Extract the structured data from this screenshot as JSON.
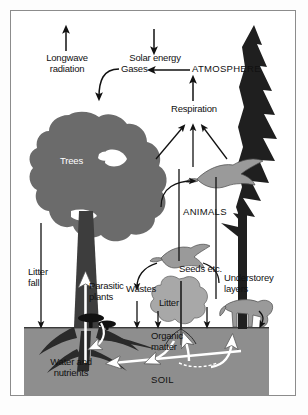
{
  "diagram": {
    "colors": {
      "background": "#ffffff",
      "border": "#8c8c8c",
      "canopy_gray": "#6b6b6b",
      "conifer_dark": "#1f1f1f",
      "soil_gray": "#8e8e8e",
      "animal_gray": "#9a9a9a",
      "shrub_gray": "#a8a8a8",
      "arrow_black": "#111111",
      "arrow_white": "#ffffff",
      "text": "#111111",
      "text_on_dark": "#ffffff"
    },
    "labels": {
      "longwave_radiation": "Longwave\nradiation",
      "solar_energy": "Solar energy",
      "gases": "Gases",
      "atmosphere": "ATMOSPHERE",
      "respiration": "Respiration",
      "trees": "Trees",
      "animals": "ANIMALS",
      "litter_fall": "Litter\nfall",
      "parasitic_plants": "Parasitic\nplants",
      "wastes": "Wastes",
      "seeds_etc": "Seeds etc.",
      "litter": "Litter",
      "understorey_layers": "Understorey\nlayers",
      "organic_matter": "Organic\nmatter",
      "water_and_nutrients": "Water and\nnutrients",
      "soil": "SOIL"
    },
    "flows": [
      {
        "name": "longwave-radiation-out",
        "label": "Longwave radiation",
        "direction": "up"
      },
      {
        "name": "solar-energy-in",
        "label": "Solar energy",
        "direction": "down"
      },
      {
        "name": "atmosphere-to-gases",
        "label": "Gases",
        "direction": "left-then-down-into-canopy"
      },
      {
        "name": "respiration-to-atmosphere",
        "label": "Respiration",
        "direction": "up"
      },
      {
        "name": "trees-to-respiration",
        "label": "",
        "direction": "up-right"
      },
      {
        "name": "understorey-to-respiration",
        "label": "",
        "direction": "up"
      },
      {
        "name": "animals-to-respiration",
        "label": "",
        "direction": "up-left"
      },
      {
        "name": "litter-fall-down",
        "label": "Litter fall",
        "direction": "down"
      },
      {
        "name": "trunk-water-uptake",
        "label": "",
        "direction": "up"
      },
      {
        "name": "parasitic-plants-to-soil",
        "label": "Parasitic plants",
        "direction": "down-curve"
      },
      {
        "name": "bird-wastes-down",
        "label": "Wastes",
        "direction": "down"
      },
      {
        "name": "bird-seeds-down",
        "label": "Seeds etc.",
        "direction": "down"
      },
      {
        "name": "litter-to-organic-matter",
        "label": "Litter",
        "direction": "down"
      },
      {
        "name": "understorey-litter-down",
        "label": "",
        "direction": "down"
      },
      {
        "name": "deer-to-soil",
        "label": "",
        "direction": "down"
      },
      {
        "name": "soil-to-roots",
        "label": "Water and nutrients",
        "direction": "left-uptake"
      },
      {
        "name": "organic-matter-to-soil-solution",
        "label": "Organic matter",
        "direction": "down-curve"
      },
      {
        "name": "soil-nutrients-to-shrub",
        "label": "",
        "direction": "up"
      },
      {
        "name": "soil-nutrients-to-understorey",
        "label": "",
        "direction": "up"
      }
    ]
  }
}
